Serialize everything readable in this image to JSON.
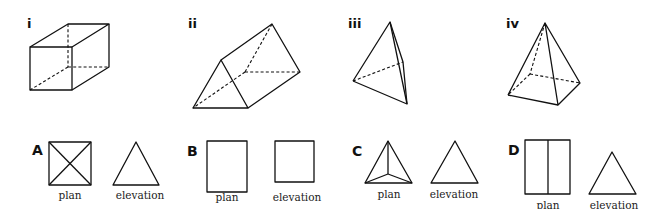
{
  "solids": [
    {
      "id": "i",
      "label": "i",
      "name": "cuboid"
    },
    {
      "id": "ii",
      "label": "ii",
      "name": "triangular prism"
    },
    {
      "id": "iii",
      "label": "iii",
      "name": "triangular pyramid"
    },
    {
      "id": "iv",
      "label": "iv",
      "name": "square pyramid"
    }
  ],
  "views": [
    {
      "id": "A",
      "label": "A",
      "plan_caption": "plan",
      "elevation_caption": "elevation",
      "plan_shape": "square with diagonals",
      "elevation_shape": "triangle"
    },
    {
      "id": "B",
      "label": "B",
      "plan_caption": "plan",
      "elevation_caption": "elevation",
      "plan_shape": "rectangle",
      "elevation_shape": "square"
    },
    {
      "id": "C",
      "label": "C",
      "plan_caption": "plan",
      "elevation_caption": "elevation",
      "plan_shape": "triangle with lines to centre",
      "elevation_shape": "triangle"
    },
    {
      "id": "D",
      "label": "D",
      "plan_caption": "plan",
      "elevation_caption": "elevation",
      "plan_shape": "rectangle split vertically",
      "elevation_shape": "triangle"
    }
  ],
  "colors": {
    "stroke": "#111111",
    "background": "#ffffff"
  }
}
